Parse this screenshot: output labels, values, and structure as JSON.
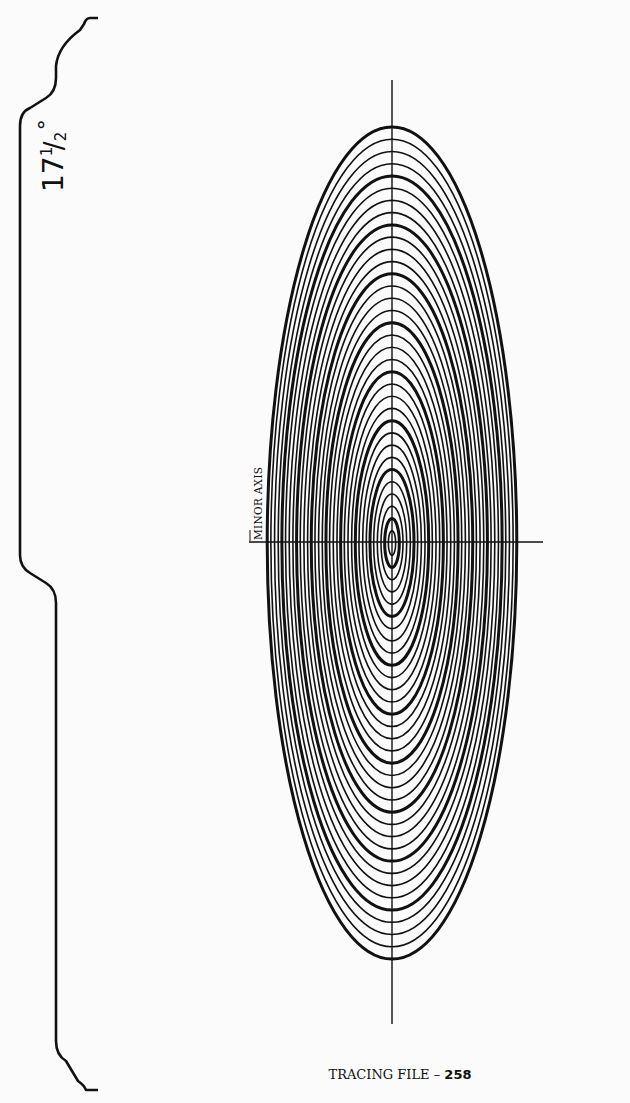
{
  "page": {
    "angle_label": {
      "whole": "17",
      "numerator": "1",
      "denominator": "2",
      "degree_symbol": "°"
    },
    "axis_label": "MINOR AXIS",
    "footer": {
      "title": "TRACING FILE –",
      "number": "258"
    }
  },
  "diagram": {
    "type": "ellipse-template",
    "projection_angle_deg": 17.5,
    "center": {
      "x": 392,
      "y": 543
    },
    "outer_semi_major_px": 416,
    "axis_ratio": 0.3,
    "ring_count": 34,
    "bold_every": 4,
    "stroke_color": "#111111",
    "vertical_axis": {
      "x": 392,
      "y1": 80,
      "y2": 1024
    },
    "horizontal_axis": {
      "y": 542,
      "x1": 249,
      "x2": 543
    },
    "bracket": {
      "top_y": 18,
      "mid_y": 585,
      "bottom_y": 1093
    }
  }
}
